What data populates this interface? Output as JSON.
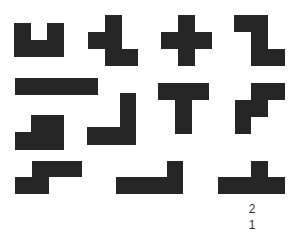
{
  "figure": {
    "background": "#ffffff",
    "fill_color": "#262626",
    "cell_size_px": 17,
    "shapes": [
      {
        "id": "shape-1",
        "name": "U-pentomino",
        "rects": [
          [
            14,
            23,
            17,
            34
          ],
          [
            47,
            23,
            17,
            34
          ],
          [
            14,
            40,
            50,
            17
          ]
        ]
      },
      {
        "id": "shape-2",
        "name": "F-pentomino",
        "rects": [
          [
            105,
            15,
            17,
            51
          ],
          [
            88,
            32,
            34,
            17
          ],
          [
            105,
            49,
            33,
            17
          ]
        ]
      },
      {
        "id": "shape-3",
        "name": "X-pentomino",
        "rects": [
          [
            178,
            15,
            17,
            51
          ],
          [
            161,
            32,
            51,
            17
          ]
        ]
      },
      {
        "id": "shape-4",
        "name": "Z-pentomino",
        "rects": [
          [
            234,
            15,
            34,
            17
          ],
          [
            251,
            15,
            17,
            51
          ],
          [
            251,
            49,
            34,
            17
          ]
        ]
      },
      {
        "id": "shape-5",
        "name": "I-pentomino",
        "rects": [
          [
            15,
            78,
            83,
            17
          ]
        ]
      },
      {
        "id": "shape-6",
        "name": "P-pentomino",
        "rects": [
          [
            31,
            115,
            33,
            35
          ],
          [
            15,
            132,
            49,
            18
          ]
        ]
      },
      {
        "id": "shape-7",
        "name": "V-pentomino",
        "rects": [
          [
            120,
            93,
            16,
            52
          ],
          [
            87,
            127,
            49,
            18
          ]
        ]
      },
      {
        "id": "shape-8",
        "name": "T-pentomino",
        "rects": [
          [
            158,
            83,
            51,
            17
          ],
          [
            175,
            83,
            17,
            51
          ]
        ]
      },
      {
        "id": "shape-9",
        "name": "W-pentomino",
        "rects": [
          [
            251,
            83,
            34,
            17
          ],
          [
            235,
            100,
            33,
            17
          ],
          [
            235,
            100,
            16,
            34
          ]
        ]
      },
      {
        "id": "shape-10",
        "name": "N-pentomino",
        "rects": [
          [
            32,
            161,
            50,
            16
          ],
          [
            15,
            177,
            34,
            17
          ]
        ]
      },
      {
        "id": "shape-11",
        "name": "L-pentomino",
        "rects": [
          [
            167,
            161,
            16,
            33
          ],
          [
            116,
            177,
            67,
            17
          ]
        ]
      },
      {
        "id": "shape-12",
        "name": "Y-pentomino",
        "rects": [
          [
            251,
            161,
            17,
            33
          ],
          [
            218,
            177,
            67,
            17
          ]
        ]
      }
    ],
    "labels": [
      {
        "text": "2",
        "x": 242,
        "y": 203
      },
      {
        "text": "1",
        "x": 242,
        "y": 219
      }
    ]
  }
}
